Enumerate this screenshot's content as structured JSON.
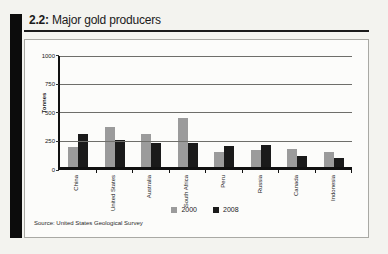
{
  "page": {
    "figure_label": "2.2:",
    "figure_title": "Major gold producers",
    "source": "Source: United States Geological Survey"
  },
  "chart_data": {
    "type": "bar",
    "title": "2.2: Major gold producers",
    "xlabel": "",
    "ylabel": "Tonnes",
    "ylim": [
      0,
      1000
    ],
    "yticks": [
      0,
      250,
      500,
      750,
      1000
    ],
    "grid": true,
    "legend_position": "bottom-center",
    "categories": [
      "China",
      "United States",
      "Australia",
      "South Africa",
      "Peru",
      "Russia",
      "Canada",
      "Indonesia"
    ],
    "series": [
      {
        "name": "2000",
        "color": "#9b9b9b",
        "values": [
          175,
          355,
          290,
          430,
          130,
          145,
          160,
          130
        ]
      },
      {
        "name": "2008",
        "color": "#1a1a1a",
        "values": [
          290,
          240,
          215,
          210,
          185,
          190,
          100,
          75
        ]
      }
    ],
    "source": "Source: United States Geological Survey"
  },
  "colors": {
    "page_background": "#f3f3ef",
    "panel_background": "#fcfcfa",
    "panel_border": "#a9a9a4",
    "stripe": "#0c0c0c",
    "gridline": "#6e6e6a",
    "axis": "#111111",
    "bar_2000": "#9b9b9b",
    "bar_2008": "#1a1a1a"
  }
}
